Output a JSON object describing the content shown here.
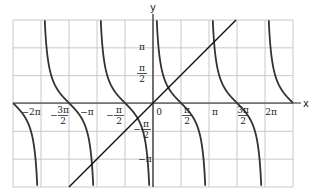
{
  "chart_data": {
    "type": "line",
    "title": "",
    "xlabel": "x",
    "ylabel": "y",
    "xlim": [
      -7.068,
      7.068
    ],
    "ylim": [
      -4.712,
      6.283
    ],
    "grid": true,
    "grid_step_x": "pi/2",
    "grid_step_y": "pi/2",
    "x_ticks": [
      "-2π",
      "-3π/2",
      "-π",
      "-π/2",
      "0",
      "π/2",
      "π",
      "3π/2",
      "2π"
    ],
    "y_ticks": [
      "-π",
      "-π/2",
      "π/2",
      "π"
    ],
    "series": [
      {
        "name": "y = cot x",
        "kind": "function",
        "asymptotes": [
          "-2π",
          "-π",
          "0",
          "π",
          "2π"
        ]
      },
      {
        "name": "y = x",
        "kind": "line",
        "points": [
          [
            -4.712,
            -4.712
          ],
          [
            4.712,
            4.712
          ]
        ]
      }
    ],
    "axis_labels": {
      "x": "x",
      "y": "y"
    }
  },
  "labels": {
    "x_axis": "x",
    "y_axis": "y",
    "origin": "0",
    "x_ticks": [
      {
        "text": "−2π",
        "num": "",
        "den": ""
      },
      {
        "text": "",
        "num": "3π",
        "den": "2",
        "sign": "−"
      },
      {
        "text": "−π",
        "num": "",
        "den": ""
      },
      {
        "text": "",
        "num": "π",
        "den": "2",
        "sign": "−"
      },
      {
        "text": "",
        "num": "π",
        "den": "2",
        "sign": ""
      },
      {
        "text": "π",
        "num": "",
        "den": ""
      },
      {
        "text": "",
        "num": "3π",
        "den": "2",
        "sign": ""
      },
      {
        "text": "2π",
        "num": "",
        "den": ""
      }
    ],
    "y_ticks": [
      {
        "text": "π"
      },
      {
        "num": "π",
        "den": "2"
      },
      {
        "num": "π",
        "den": "2",
        "sign": "−"
      },
      {
        "text": "−π"
      }
    ]
  }
}
